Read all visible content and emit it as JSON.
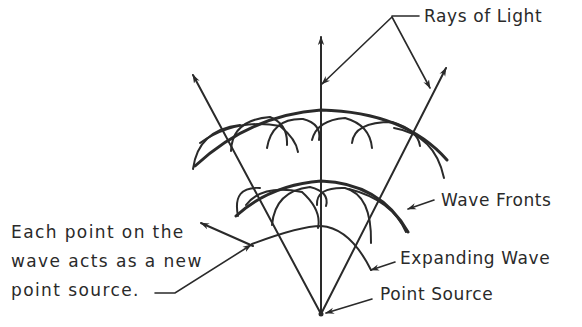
{
  "diagram": {
    "type": "huygens-principle",
    "labels": {
      "rays": "Rays of Light",
      "wave_fronts": "Wave Fronts",
      "expanding_wave": "Expanding Wave",
      "point_source": "Point Source",
      "each_point_line1": "Each point on the",
      "each_point_line2": "wave acts as a new",
      "each_point_line3": "point source."
    },
    "colors": {
      "ink": "#2a2a2a",
      "background": "#ffffff"
    }
  }
}
